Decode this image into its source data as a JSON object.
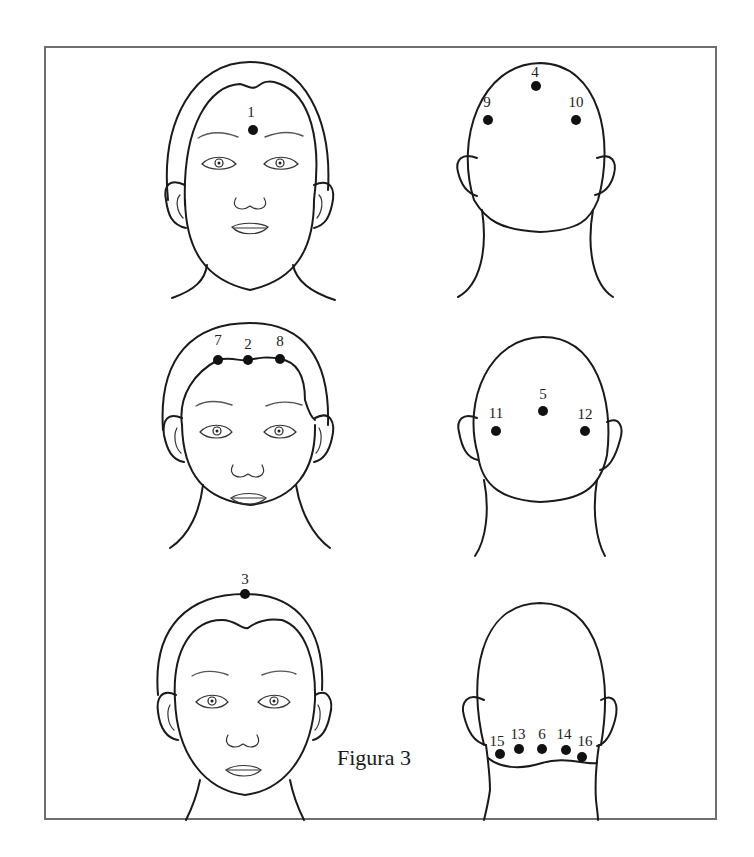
{
  "figure": {
    "caption": "Figura 3",
    "frame_color": "#6f6f6f",
    "point_color": "#111111"
  },
  "panels": [
    {
      "id": "front-top",
      "view": "front",
      "row": 1,
      "col": 1,
      "points": [
        {
          "label": "1",
          "x": 253,
          "y": 130
        }
      ]
    },
    {
      "id": "back-top",
      "view": "back",
      "row": 1,
      "col": 2,
      "points": [
        {
          "label": "4",
          "x": 536,
          "y": 86
        },
        {
          "label": "9",
          "x": 488,
          "y": 120
        },
        {
          "label": "10",
          "x": 576,
          "y": 120
        }
      ]
    },
    {
      "id": "front-middle",
      "view": "front",
      "row": 2,
      "col": 1,
      "points": [
        {
          "label": "7",
          "x": 218,
          "y": 360
        },
        {
          "label": "2",
          "x": 248,
          "y": 360
        },
        {
          "label": "8",
          "x": 280,
          "y": 359
        }
      ]
    },
    {
      "id": "back-middle",
      "view": "back",
      "row": 2,
      "col": 2,
      "points": [
        {
          "label": "5",
          "x": 543,
          "y": 411
        },
        {
          "label": "11",
          "x": 496,
          "y": 431
        },
        {
          "label": "12",
          "x": 585,
          "y": 431
        }
      ]
    },
    {
      "id": "front-bottom",
      "view": "front",
      "row": 3,
      "col": 1,
      "points": [
        {
          "label": "3",
          "x": 245,
          "y": 594
        }
      ]
    },
    {
      "id": "back-bottom",
      "view": "back",
      "row": 3,
      "col": 2,
      "points": [
        {
          "label": "15",
          "x": 500,
          "y": 754
        },
        {
          "label": "13",
          "x": 519,
          "y": 749
        },
        {
          "label": "6",
          "x": 542,
          "y": 749
        },
        {
          "label": "14",
          "x": 566,
          "y": 750
        },
        {
          "label": "16",
          "x": 582,
          "y": 757
        }
      ]
    }
  ],
  "labels": {
    "p1": "1",
    "p2": "2",
    "p3": "3",
    "p4": "4",
    "p5": "5",
    "p6": "6",
    "p7": "7",
    "p8": "8",
    "p9": "9",
    "p10": "10",
    "p11": "11",
    "p12": "12",
    "p13": "13",
    "p14": "14",
    "p15": "15",
    "p16": "16"
  }
}
